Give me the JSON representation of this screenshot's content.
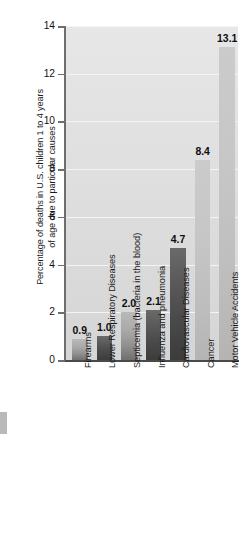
{
  "chart_data": {
    "type": "bar",
    "title": "",
    "xlabel": "",
    "ylabel": "Percentage of deaths in U.S. children 1 to 4 years of age due to particular causes",
    "ylabel_line1": "Percentage of deaths in U.S. children 1 to 4 years",
    "ylabel_line2": "of age due to particular causes",
    "ylim": [
      0,
      14
    ],
    "ytick_values": [
      0,
      2,
      4,
      6,
      8,
      10,
      12,
      14
    ],
    "ytick_labels": [
      "0",
      "2",
      "4",
      "6",
      "8",
      "10",
      "12",
      "14"
    ],
    "grid": true,
    "grid_axis": "y",
    "legend": "none",
    "categories": [
      "Firearms",
      "Lower Respiratory Diseases",
      "Septicemia (bacteria in the blood)",
      "Influenza and pneumonia",
      "Cardiovascular Diseases",
      "Cancer",
      "Motor Vehicle Accidents"
    ],
    "values": [
      0.9,
      1.0,
      2.0,
      2.1,
      4.7,
      8.4,
      13.1
    ],
    "value_labels": [
      "0.9",
      "1.0",
      "2.0",
      "2.1",
      "4.7",
      "8.4",
      "13.1"
    ],
    "bar_shades": [
      "mid",
      "dark",
      "mid",
      "dark",
      "dark",
      "light",
      "light"
    ],
    "colors": {
      "plot_background": "#e0e0e0",
      "gridline": "#f4f4f4",
      "axis": "#5a5a5a",
      "bar_light": "#c6c6c6",
      "bar_mid": "#a8a8a8",
      "bar_dark": "#4a4a4a",
      "text": "#1a1a1a"
    }
  }
}
